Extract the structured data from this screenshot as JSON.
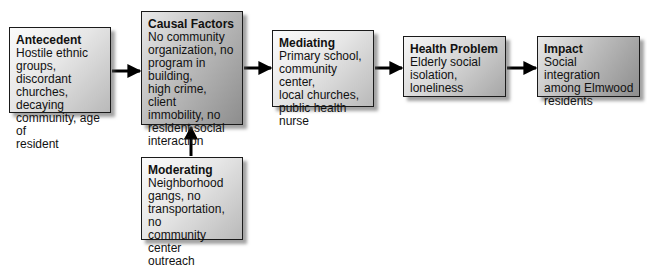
{
  "diagram": {
    "nodes": {
      "antecedent": {
        "title": "Antecedent",
        "body": "Hostile ethnic\ngroups, discordant\nchurches, decaying\ncommunity, age of\nresident"
      },
      "causal_factors": {
        "title": "Causal Factors",
        "body": "No community\norganization, no\nprogram in building,\nhigh crime, client\nimmobility, no\nresident social\ninteraction"
      },
      "mediating": {
        "title": "Mediating",
        "body": "Primary school,\ncommunity center,\nlocal churches,\npublic health nurse"
      },
      "health_problem": {
        "title": "Health Problem",
        "body": "Elderly social\nisolation,\nloneliness"
      },
      "impact": {
        "title": "Impact",
        "body": "Social integration\namong Elmwood\nresidents"
      },
      "moderating": {
        "title": "Moderating",
        "body": "Neighborhood\ngangs, no\ntransportation, no\ncommunity center\noutreach"
      }
    },
    "edges": [
      {
        "from": "antecedent",
        "to": "causal_factors"
      },
      {
        "from": "causal_factors",
        "to": "mediating"
      },
      {
        "from": "mediating",
        "to": "health_problem"
      },
      {
        "from": "health_problem",
        "to": "impact"
      },
      {
        "from": "moderating",
        "to": "causal_factors"
      }
    ],
    "colors": {
      "border": "#1a1a1a",
      "arrow": "#000000",
      "box_fill_light": "#e6e6e6",
      "box_fill_dark": "#8d8d8d"
    }
  }
}
